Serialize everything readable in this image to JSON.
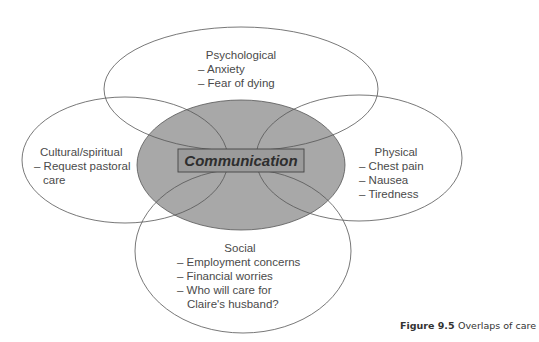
{
  "diagram": {
    "type": "venn-overlap",
    "center": {
      "label": "Communication",
      "fill": "#a6a6a6"
    },
    "circles": [
      {
        "id": "psychological",
        "title": "Psychological",
        "items": [
          "– Anxiety",
          "– Fear of dying"
        ]
      },
      {
        "id": "cultural",
        "title": "Cultural/spiritual",
        "items": [
          "– Request pastoral",
          "  care"
        ]
      },
      {
        "id": "physical",
        "title": "Physical",
        "items": [
          "– Chest pain",
          "– Nausea",
          "– Tiredness"
        ]
      },
      {
        "id": "social",
        "title": "Social",
        "items": [
          "– Employment concerns",
          "– Financial worries",
          "– Who will care for",
          "  Claire's husband?"
        ]
      }
    ],
    "stroke_color": "#555555"
  },
  "caption": {
    "figure_label": "Figure 9.5",
    "text": "Overlaps of care"
  }
}
